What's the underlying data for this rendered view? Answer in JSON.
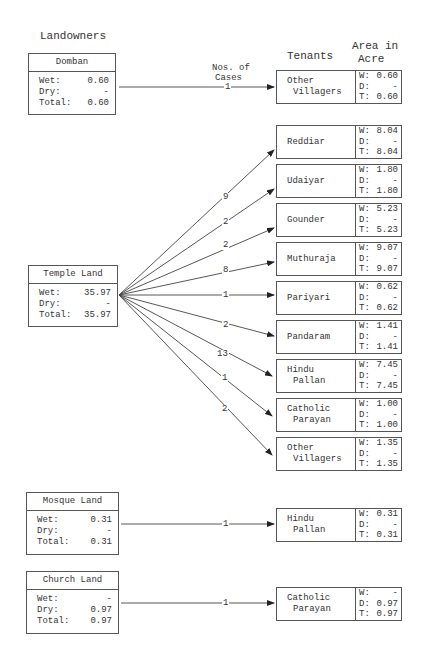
{
  "headers": {
    "landowners": "Landowners",
    "tenants": "Tenants",
    "area_line1": "Area in",
    "area_line2": "Acre",
    "cases_line1": "Nos. of",
    "cases_line2": "Cases"
  },
  "labels": {
    "wet": "Wet:",
    "dry": "Dry:",
    "total": "Total:",
    "w": "W:",
    "d": "D:",
    "t": "T:"
  },
  "landowners": [
    {
      "name": "Domban",
      "wet": "0.60",
      "dry": "-",
      "total": "0.60"
    },
    {
      "name": "Temple Land",
      "wet": "35.97",
      "dry": "-",
      "total": "35.97"
    },
    {
      "name": "Mosque Land",
      "wet": "0.31",
      "dry": "-",
      "total": "0.31"
    },
    {
      "name": "Church Land",
      "wet": "-",
      "dry": "0.97",
      "total": "0.97"
    }
  ],
  "tenants": [
    {
      "owner": "Domban",
      "line1": "Other",
      "line2": "Villagers",
      "cases": "1",
      "w": "0.60",
      "d": "-",
      "t": "0.60"
    },
    {
      "owner": "Temple Land",
      "line1": "Reddiar",
      "line2": "",
      "cases": "9",
      "w": "8.04",
      "d": "-",
      "t": "8.04"
    },
    {
      "owner": "Temple Land",
      "line1": "Udaiyar",
      "line2": "",
      "cases": "2",
      "w": "1.80",
      "d": "-",
      "t": "1.80"
    },
    {
      "owner": "Temple Land",
      "line1": "Gounder",
      "line2": "",
      "cases": "2",
      "w": "5.23",
      "d": "-",
      "t": "5.23"
    },
    {
      "owner": "Temple Land",
      "line1": "Muthuraja",
      "line2": "",
      "cases": "8",
      "w": "9.07",
      "d": "-",
      "t": "9.07"
    },
    {
      "owner": "Temple Land",
      "line1": "Pariyari",
      "line2": "",
      "cases": "1",
      "w": "0.62",
      "d": "-",
      "t": "0.62"
    },
    {
      "owner": "Temple Land",
      "line1": "Pandaram",
      "line2": "",
      "cases": "2",
      "w": "1.41",
      "d": "-",
      "t": "1.41"
    },
    {
      "owner": "Temple Land",
      "line1": "Hindu",
      "line2": "Pallan",
      "cases": "13",
      "w": "7.45",
      "d": "-",
      "t": "7.45"
    },
    {
      "owner": "Temple Land",
      "line1": "Catholic",
      "line2": "Parayan",
      "cases": "1",
      "w": "1.00",
      "d": "-",
      "t": "1.00"
    },
    {
      "owner": "Temple Land",
      "line1": "Other",
      "line2": "Villagers",
      "cases": "2",
      "w": "1.35",
      "d": "-",
      "t": "1.35"
    },
    {
      "owner": "Mosque Land",
      "line1": "Hindu",
      "line2": "Pallan",
      "cases": "1",
      "w": "0.31",
      "d": "-",
      "t": "0.31"
    },
    {
      "owner": "Church Land",
      "line1": "Catholic",
      "line2": "Parayan",
      "cases": "1",
      "w": "-",
      "d": "0.97",
      "t": "0.97"
    }
  ]
}
